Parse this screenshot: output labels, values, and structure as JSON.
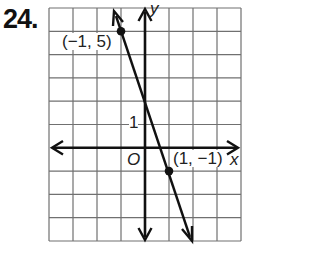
{
  "problem_number": "24.",
  "graph": {
    "x_axis_label": "x",
    "y_axis_label": "y",
    "origin_label": "O",
    "tick_label_y1": "1",
    "grid": {
      "x_min": -4,
      "x_max": 4,
      "y_min": -4,
      "y_max": 6
    },
    "line": {
      "slope": -3,
      "y_intercept": 2
    },
    "points": [
      {
        "label": "(−1, 5)",
        "x": -1,
        "y": 5
      },
      {
        "label": "(1, −1)",
        "x": 1,
        "y": -1
      }
    ],
    "colors": {
      "grid": "#6b6b6b",
      "axes": "#111111",
      "line": "#111111",
      "background": "#ffffff"
    }
  }
}
